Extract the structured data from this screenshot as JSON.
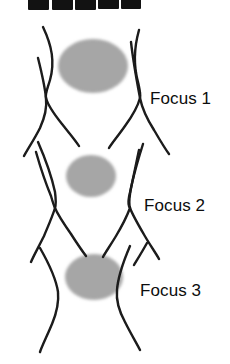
{
  "figure": {
    "background_color": "#ffffff",
    "line_color": "#1a1a1a",
    "blob_color": "#9a9a9a",
    "label_color": "#0d0d0d",
    "width": 230,
    "height": 364
  },
  "gel_strip": {
    "name": "cropped-gel-bands",
    "band_color": "#121212",
    "count": 5,
    "bands": [
      {
        "label": "band-1",
        "x": 28,
        "width": 21,
        "height": 10
      },
      {
        "label": "band-2",
        "x": 52,
        "width": 21,
        "height": 10
      },
      {
        "label": "band-3",
        "x": 75,
        "width": 21,
        "height": 10
      },
      {
        "label": "band-4",
        "x": 98,
        "width": 21,
        "height": 9
      },
      {
        "label": "band-5",
        "x": 121,
        "width": 20,
        "height": 9
      }
    ]
  },
  "blobs": [
    {
      "name": "focus-blob-1",
      "cx": 93,
      "cy": 66,
      "rx": 35,
      "ry": 27
    },
    {
      "name": "focus-blob-2",
      "cx": 91,
      "cy": 176,
      "rx": 25,
      "ry": 21
    },
    {
      "name": "focus-blob-3",
      "cx": 94,
      "cy": 277,
      "rx": 29,
      "ry": 23
    }
  ],
  "labels": [
    {
      "name": "focus-label-1",
      "text": "Focus 1",
      "x": 150,
      "y": 90
    },
    {
      "name": "focus-label-2",
      "text": "Focus 2",
      "x": 144,
      "y": 197
    },
    {
      "name": "focus-label-3",
      "text": "Focus 3",
      "x": 140,
      "y": 282
    }
  ],
  "crossings": [
    {
      "name": "crossing-left-1",
      "x": 46,
      "y": 98
    },
    {
      "name": "crossing-right-1",
      "x": 140,
      "y": 98
    },
    {
      "name": "crossing-left-2",
      "x": 55,
      "y": 208
    },
    {
      "name": "crossing-right-2",
      "x": 130,
      "y": 208
    }
  ],
  "chart_data": {
    "type": "diagram",
    "title": "",
    "series": [
      {
        "name": "Focus 1",
        "blob_rx": 35,
        "blob_ry": 27,
        "center_y": 66
      },
      {
        "name": "Focus 2",
        "blob_rx": 25,
        "blob_ry": 21,
        "center_y": 176
      },
      {
        "name": "Focus 3",
        "blob_rx": 29,
        "blob_ry": 23,
        "center_y": 277
      }
    ]
  }
}
